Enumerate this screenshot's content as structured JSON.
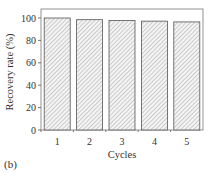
{
  "chart_data": {
    "type": "bar",
    "title": "",
    "panel_label": "(b)",
    "xlabel": "Cycles",
    "ylabel": "Recovery rate (%)",
    "categories": [
      "1",
      "2",
      "3",
      "4",
      "5"
    ],
    "values": [
      100,
      98.5,
      97.8,
      97.2,
      96.5
    ],
    "ylim": [
      0,
      105
    ],
    "yticks": [
      0,
      20,
      40,
      60,
      80,
      100
    ],
    "grid": false,
    "legend": null,
    "bar_fill": "hatched",
    "bar_stroke": "#555555"
  }
}
